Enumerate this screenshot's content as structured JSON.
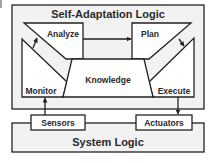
{
  "diagram": {
    "outer_box": {
      "label": "Self-Adaptation Logic"
    },
    "components": {
      "monitor": {
        "label": "Monitor"
      },
      "analyze": {
        "label": "Analyze"
      },
      "plan": {
        "label": "Plan"
      },
      "execute": {
        "label": "Execute"
      },
      "knowledge": {
        "label": "Knowledge"
      }
    },
    "interfaces": {
      "sensors": {
        "label": "Sensors"
      },
      "actuators": {
        "label": "Actuators"
      }
    },
    "system_box": {
      "label": "System Logic"
    },
    "edges": [
      {
        "from": "Monitor",
        "to": "Analyze"
      },
      {
        "from": "Analyze",
        "to": "Plan"
      },
      {
        "from": "Plan",
        "to": "Execute"
      },
      {
        "from": "Sensors",
        "to": "Monitor"
      },
      {
        "from": "Execute",
        "to": "Actuators"
      }
    ],
    "colors": {
      "stroke": "#222222",
      "text": "#2a2a2a",
      "panel_fill": "#f2f2f2",
      "box_fill": "#ffffff"
    }
  }
}
